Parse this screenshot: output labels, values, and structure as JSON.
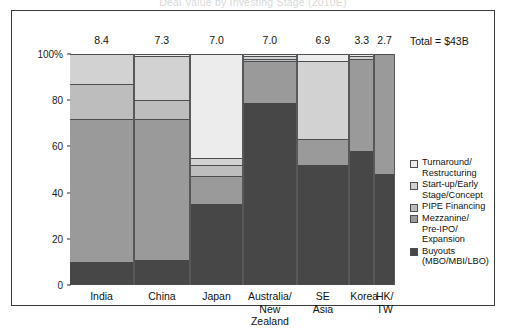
{
  "chart_title": "Deal Value by Investing Stage (2010E)",
  "total_label": "Total = $43B",
  "y_axis": {
    "ticks": [
      "100%",
      "80",
      "60",
      "40",
      "20",
      "0"
    ],
    "values": [
      100,
      80,
      60,
      40,
      20,
      0
    ]
  },
  "legend": {
    "entries": [
      {
        "label_lines": [
          "Turnaround/",
          "Restructuring"
        ],
        "color": "#ececec"
      },
      {
        "label_lines": [
          "Start-up/Early",
          "Stage/Concept"
        ],
        "color": "#d2d2d2"
      },
      {
        "label_lines": [
          "PIPE Financing"
        ],
        "color": "#bdbdbd"
      },
      {
        "label_lines": [
          "Mezzanine/",
          "Pre-IPO/",
          "Expansion"
        ],
        "color": "#9a9a9a"
      },
      {
        "label_lines": [
          "Buyouts",
          "(MBO/MBI/LBO)"
        ],
        "color": "#474747"
      }
    ]
  },
  "chart_data": {
    "type": "bar",
    "subtype": "100% stacked column, variable column width",
    "title": "Deal Value by Investing Stage (2010E)",
    "xlabel": "",
    "ylabel": "",
    "ylim": [
      0,
      100
    ],
    "yticks": [
      0,
      20,
      40,
      60,
      80,
      100
    ],
    "ytick_labels": [
      "0",
      "20",
      "40",
      "60",
      "80",
      "100%"
    ],
    "grid": false,
    "legend_position": "right",
    "annotation_total": "Total = $43B",
    "categories": [
      "India",
      "China",
      "Japan",
      "Australia/ New Zealand",
      "SE Asia",
      "Korea",
      "HK/ TW"
    ],
    "category_lines": [
      [
        "India"
      ],
      [
        "China"
      ],
      [
        "Japan"
      ],
      [
        "Australia/",
        "New Zealand"
      ],
      [
        "SE",
        "Asia"
      ],
      [
        "Korea"
      ],
      [
        "HK/",
        "TW"
      ]
    ],
    "column_values_usd_billions": [
      8.4,
      7.3,
      7.0,
      7.0,
      6.9,
      3.3,
      2.7
    ],
    "column_value_labels": [
      "8.4",
      "7.3",
      "7.0",
      "7.0",
      "6.9",
      "3.3",
      "2.7"
    ],
    "series": [
      {
        "name": "Buyouts (MBO/MBI/LBO)",
        "color": "#474747",
        "values": [
          10,
          11,
          35,
          79,
          52,
          58,
          48
        ]
      },
      {
        "name": "Mezzanine/Pre-IPO/Expansion",
        "color": "#9a9a9a",
        "values": [
          62,
          61,
          12,
          18,
          11,
          40,
          52
        ]
      },
      {
        "name": "PIPE Financing",
        "color": "#bdbdbd",
        "values": [
          15,
          8,
          5,
          1,
          0,
          0,
          0
        ]
      },
      {
        "name": "Start-up/Early Stage/Concept",
        "color": "#d2d2d2",
        "values": [
          13,
          19,
          3,
          1,
          34,
          1,
          0
        ]
      },
      {
        "name": "Turnaround/Restructuring",
        "color": "#ececec",
        "values": [
          0,
          1,
          45,
          1,
          3,
          1,
          0
        ]
      }
    ]
  }
}
